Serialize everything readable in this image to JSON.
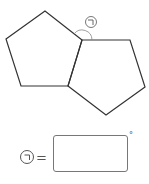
{
  "figure": {
    "left_pentagon": [
      [
        45,
        11
      ],
      [
        6,
        39
      ],
      [
        21,
        86
      ],
      [
        68,
        86
      ],
      [
        82,
        40
      ]
    ],
    "right_pentagon": [
      [
        82,
        40
      ],
      [
        130,
        40
      ],
      [
        145,
        87
      ],
      [
        106,
        115
      ],
      [
        68,
        86
      ]
    ],
    "angle_label": "ㄱ",
    "angle_vertex": [
      82,
      40
    ],
    "stroke_color": "#333333",
    "arc_color": "#888888"
  },
  "question": {
    "label": "ㄱ",
    "equals": "=",
    "answer_value": "",
    "unit": "°"
  }
}
